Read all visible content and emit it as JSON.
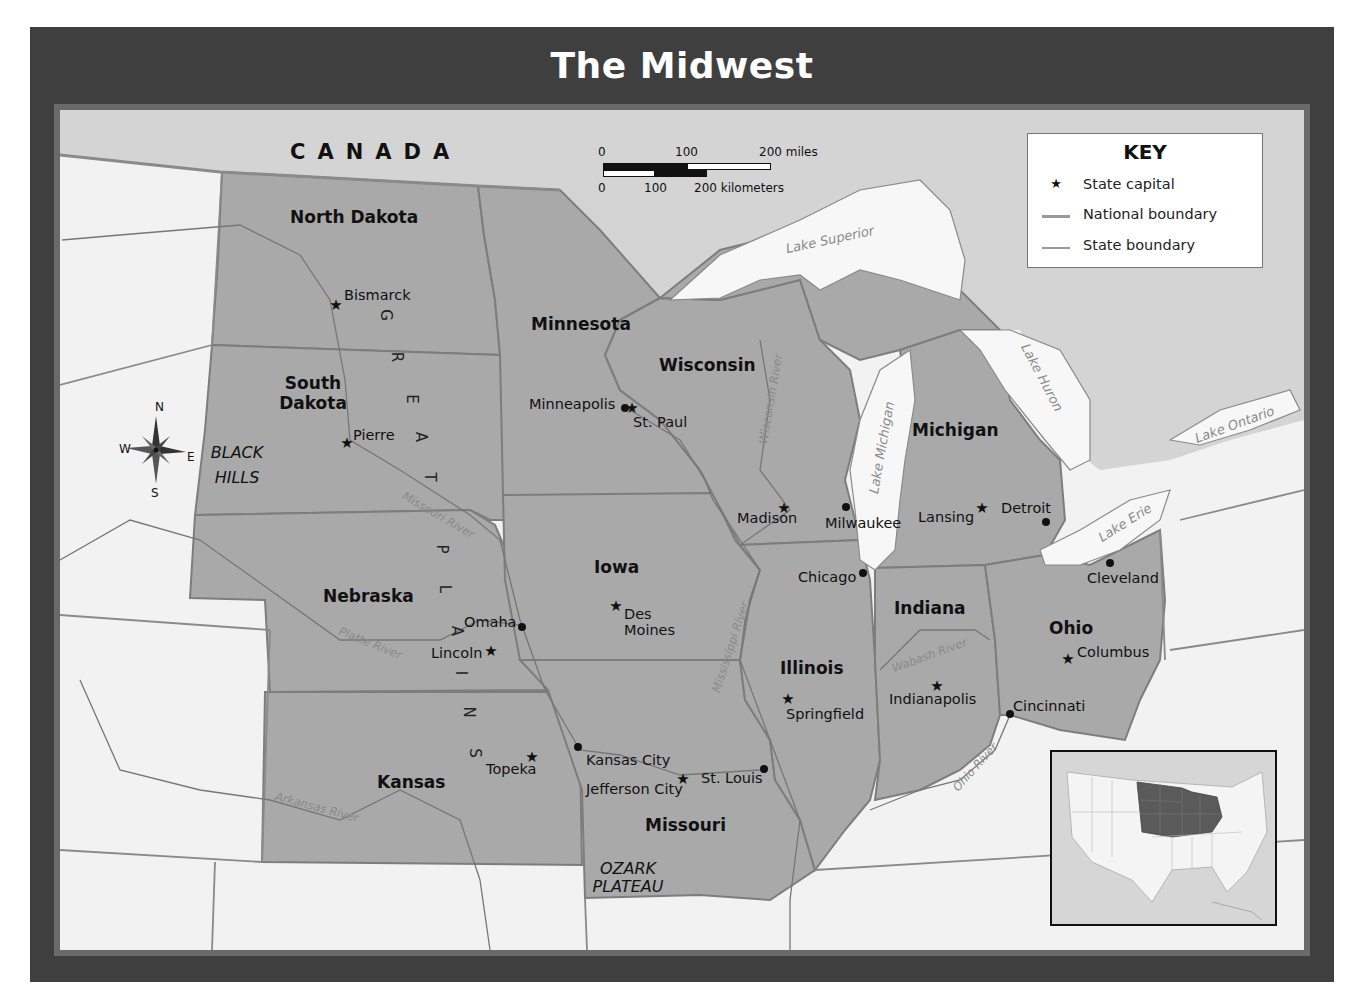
{
  "title": "The Midwest",
  "key": {
    "title": "KEY",
    "items": [
      {
        "symbol": "star",
        "label": "State capital"
      },
      {
        "symbol": "thick-line",
        "label": "National boundary"
      },
      {
        "symbol": "thin-line",
        "label": "State boundary"
      }
    ]
  },
  "scale_bar": {
    "miles": {
      "ticks": [
        "0",
        "100",
        "200 miles"
      ]
    },
    "kilometers": {
      "ticks": [
        "0",
        "100",
        "200 kilometers"
      ]
    }
  },
  "compass": {
    "n": "N",
    "s": "S",
    "e": "E",
    "w": "W"
  },
  "country_labels": [
    {
      "name": "CANADA"
    }
  ],
  "states": [
    {
      "name": "North Dakota"
    },
    {
      "name": "South Dakota"
    },
    {
      "name": "Nebraska"
    },
    {
      "name": "Kansas"
    },
    {
      "name": "Minnesota"
    },
    {
      "name": "Iowa"
    },
    {
      "name": "Missouri"
    },
    {
      "name": "Wisconsin"
    },
    {
      "name": "Illinois"
    },
    {
      "name": "Michigan"
    },
    {
      "name": "Indiana"
    },
    {
      "name": "Ohio"
    }
  ],
  "capitals": [
    {
      "name": "Bismarck"
    },
    {
      "name": "Pierre"
    },
    {
      "name": "Lincoln"
    },
    {
      "name": "Topeka"
    },
    {
      "name": "St. Paul"
    },
    {
      "name": "Des Moines"
    },
    {
      "name": "Jefferson City"
    },
    {
      "name": "Madison"
    },
    {
      "name": "Springfield"
    },
    {
      "name": "Lansing"
    },
    {
      "name": "Indianapolis"
    },
    {
      "name": "Columbus"
    }
  ],
  "cities": [
    {
      "name": "Minneapolis"
    },
    {
      "name": "Omaha"
    },
    {
      "name": "Kansas City"
    },
    {
      "name": "St. Louis"
    },
    {
      "name": "Milwaukee"
    },
    {
      "name": "Chicago"
    },
    {
      "name": "Detroit"
    },
    {
      "name": "Cleveland"
    },
    {
      "name": "Cincinnati"
    }
  ],
  "regions": [
    {
      "name": "BLACK HILLS"
    },
    {
      "name": "OZARK PLATEAU"
    },
    {
      "name": "GREAT PLAINS",
      "letters": [
        "G",
        "R",
        "E",
        "A",
        "T",
        "P",
        "L",
        "A",
        "I",
        "N",
        "S"
      ]
    }
  ],
  "water_features": [
    {
      "name": "Lake Superior"
    },
    {
      "name": "Lake Michigan"
    },
    {
      "name": "Lake Huron"
    },
    {
      "name": "Lake Erie"
    },
    {
      "name": "Lake Ontario"
    },
    {
      "name": "Missouri River"
    },
    {
      "name": "Platte River"
    },
    {
      "name": "Arkansas River"
    },
    {
      "name": "Mississippi River"
    },
    {
      "name": "Wisconsin River"
    },
    {
      "name": "Wabash River"
    },
    {
      "name": "Ohio River"
    }
  ],
  "colors": {
    "frame": "#3f3f3f",
    "midwest_fill": "#a9a9a9",
    "other_land": "#f2f2f2",
    "canada_fill": "#d4d4d4",
    "water": "#f7f7f7",
    "state_border": "#7d7d7d",
    "inset_highlight": "#5a5a5a"
  }
}
